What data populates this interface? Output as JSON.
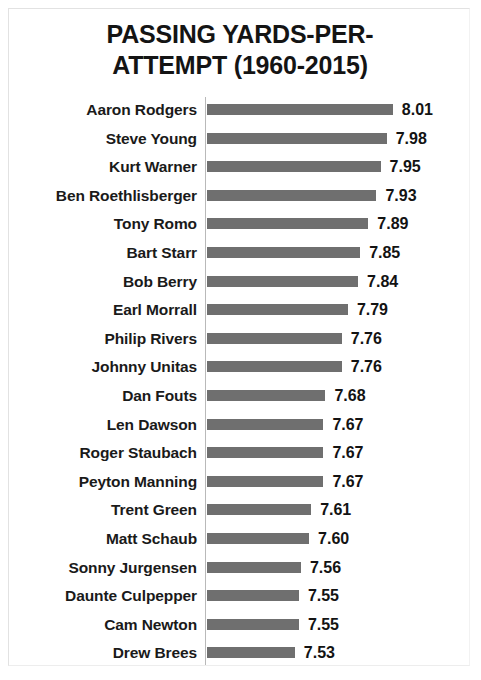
{
  "chart_data": {
    "type": "bar",
    "orientation": "horizontal",
    "title_lines": [
      "PASSING YARDS-PER-",
      "ATTEMPT (1960-2015)"
    ],
    "xlabel": "",
    "ylabel": "",
    "grid": false,
    "legend": false,
    "xlim": [
      7.1,
      8.06
    ],
    "bar_color": "#6f6f6f",
    "axis_color": "#b9b9b9",
    "categories": [
      "Aaron Rodgers",
      "Steve Young",
      "Kurt Warner",
      "Ben Roethlisberger",
      "Tony Romo",
      "Bart Starr",
      "Bob Berry",
      "Earl Morrall",
      "Philip Rivers",
      "Johnny Unitas",
      "Dan Fouts",
      "Len Dawson",
      "Roger Staubach",
      "Peyton Manning",
      "Trent Green",
      "Matt Schaub",
      "Sonny Jurgensen",
      "Daunte Culpepper",
      "Cam Newton",
      "Drew Brees"
    ],
    "values": [
      8.01,
      7.98,
      7.95,
      7.93,
      7.89,
      7.85,
      7.84,
      7.79,
      7.76,
      7.76,
      7.68,
      7.67,
      7.67,
      7.67,
      7.61,
      7.6,
      7.56,
      7.55,
      7.55,
      7.53
    ],
    "value_labels": [
      "8.01",
      "7.98",
      "7.95",
      "7.93",
      "7.89",
      "7.85",
      "7.84",
      "7.79",
      "7.76",
      "7.76",
      "7.68",
      "7.67",
      "7.67",
      "7.67",
      "7.61",
      "7.60",
      "7.56",
      "7.55",
      "7.55",
      "7.53"
    ]
  }
}
